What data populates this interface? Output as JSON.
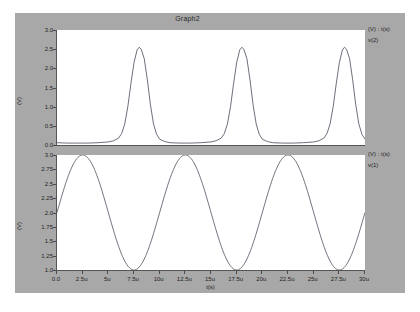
{
  "window": {
    "title": "Graph2",
    "background_color": "#a8a8a8",
    "plot_background_color": "#ffffff",
    "trace_color": "#4a4a5a"
  },
  "xaxis": {
    "label": "t(s)",
    "ticks": [
      "0.0",
      "2.5u",
      "5u",
      "7.5u",
      "10u",
      "12.5u",
      "15u",
      "17.5u",
      "20u",
      "22.5u",
      "25u",
      "27.5u",
      "30u"
    ],
    "min": 0,
    "max": 3e-05
  },
  "panels": [
    {
      "id": "top",
      "legend_axis": "(V) : t(s)",
      "legend_trace": "v(2)",
      "yaxis_label": "(V)",
      "yticks": [
        "3.0",
        "2.5",
        "2.0",
        "1.5",
        "1.0",
        "0.5",
        "0.0"
      ],
      "ymin": 0.0,
      "ymax": 3.0
    },
    {
      "id": "bottom",
      "legend_axis": "(V) : t(s)",
      "legend_trace": "v(1)",
      "yaxis_label": "(V)",
      "yticks": [
        "3.0",
        "2.75",
        "2.5",
        "2.25",
        "2.0",
        "1.75",
        "1.5",
        "1.25",
        "1.0"
      ],
      "ymin": 1.0,
      "ymax": 3.0
    }
  ],
  "chart_data": [
    {
      "type": "line",
      "id": "top",
      "title": "Graph2",
      "xlabel": "t(s)",
      "ylabel": "(V)",
      "xlim": [
        0,
        3e-05
      ],
      "ylim": [
        0.0,
        3.0
      ],
      "xtick_labels": [
        "0.0",
        "2.5u",
        "5u",
        "7.5u",
        "10u",
        "12.5u",
        "15u",
        "17.5u",
        "20u",
        "22.5u",
        "25u",
        "27.5u",
        "30u"
      ],
      "ytick_labels": [
        "0.0",
        "0.5",
        "1.0",
        "1.5",
        "2.0",
        "2.5",
        "3.0"
      ],
      "grid": false,
      "legend": [
        "v(2)"
      ],
      "legend_position": "right",
      "series": [
        {
          "name": "v(2)",
          "description": "Narrow rectified pulse train, peak 2.55 V near t=8u, 18u, 28u; baseline ~0.05 V, period 10u",
          "period_s": 1e-05,
          "peak_v": 2.55,
          "baseline_v": 0.05,
          "peak_times_s": [
            8e-06,
            1.8e-05,
            2.8e-05
          ],
          "points": [
            [
              0.0,
              0.06
            ],
            [
              1e-06,
              0.05
            ],
            [
              2e-06,
              0.05
            ],
            [
              3e-06,
              0.05
            ],
            [
              4e-06,
              0.06
            ],
            [
              5e-06,
              0.08
            ],
            [
              5.5e-06,
              0.11
            ],
            [
              6e-06,
              0.18
            ],
            [
              6.3e-06,
              0.3
            ],
            [
              6.6e-06,
              0.55
            ],
            [
              6.9e-06,
              1.0
            ],
            [
              7.2e-06,
              1.6
            ],
            [
              7.5e-06,
              2.15
            ],
            [
              7.8e-06,
              2.48
            ],
            [
              8e-06,
              2.55
            ],
            [
              8.2e-06,
              2.5
            ],
            [
              8.5e-06,
              2.25
            ],
            [
              8.8e-06,
              1.7
            ],
            [
              9.1e-06,
              1.05
            ],
            [
              9.4e-06,
              0.55
            ],
            [
              9.7e-06,
              0.28
            ],
            [
              1e-05,
              0.15
            ],
            [
              1.05e-05,
              0.09
            ],
            [
              1.1e-05,
              0.06
            ],
            [
              1.2e-05,
              0.05
            ],
            [
              1.3e-05,
              0.05
            ],
            [
              1.4e-05,
              0.06
            ],
            [
              1.5e-05,
              0.08
            ],
            [
              1.55e-05,
              0.11
            ],
            [
              1.6e-05,
              0.18
            ],
            [
              1.63e-05,
              0.3
            ],
            [
              1.66e-05,
              0.55
            ],
            [
              1.69e-05,
              1.0
            ],
            [
              1.72e-05,
              1.6
            ],
            [
              1.75e-05,
              2.15
            ],
            [
              1.78e-05,
              2.48
            ],
            [
              1.8e-05,
              2.55
            ],
            [
              1.82e-05,
              2.5
            ],
            [
              1.85e-05,
              2.25
            ],
            [
              1.88e-05,
              1.7
            ],
            [
              1.91e-05,
              1.05
            ],
            [
              1.94e-05,
              0.55
            ],
            [
              1.97e-05,
              0.28
            ],
            [
              2e-05,
              0.15
            ],
            [
              2.05e-05,
              0.09
            ],
            [
              2.1e-05,
              0.06
            ],
            [
              2.2e-05,
              0.05
            ],
            [
              2.3e-05,
              0.05
            ],
            [
              2.4e-05,
              0.06
            ],
            [
              2.5e-05,
              0.08
            ],
            [
              2.55e-05,
              0.11
            ],
            [
              2.6e-05,
              0.18
            ],
            [
              2.63e-05,
              0.3
            ],
            [
              2.66e-05,
              0.55
            ],
            [
              2.69e-05,
              1.0
            ],
            [
              2.72e-05,
              1.6
            ],
            [
              2.75e-05,
              2.15
            ],
            [
              2.78e-05,
              2.48
            ],
            [
              2.8e-05,
              2.55
            ],
            [
              2.82e-05,
              2.5
            ],
            [
              2.85e-05,
              2.25
            ],
            [
              2.88e-05,
              1.7
            ],
            [
              2.91e-05,
              1.05
            ],
            [
              2.94e-05,
              0.55
            ],
            [
              2.97e-05,
              0.28
            ],
            [
              3e-05,
              0.15
            ]
          ]
        }
      ]
    },
    {
      "type": "line",
      "id": "bottom",
      "xlabel": "t(s)",
      "ylabel": "(V)",
      "xlim": [
        0,
        3e-05
      ],
      "ylim": [
        1.0,
        3.0
      ],
      "xtick_labels": [
        "0.0",
        "2.5u",
        "5u",
        "7.5u",
        "10u",
        "12.5u",
        "15u",
        "17.5u",
        "20u",
        "22.5u",
        "25u",
        "27.5u",
        "30u"
      ],
      "ytick_labels": [
        "1.0",
        "1.25",
        "1.5",
        "1.75",
        "2.0",
        "2.25",
        "2.5",
        "2.75",
        "3.0"
      ],
      "grid": false,
      "legend": [
        "v(1)"
      ],
      "legend_position": "right",
      "series": [
        {
          "name": "v(1)",
          "description": "Sine wave, offset 2.0 V, amplitude 1.0 V, period 10u, rising through 2.0 V at t=0",
          "offset_v": 2.0,
          "amplitude_v": 1.0,
          "period_s": 1e-05,
          "phase_deg": 0
        }
      ]
    }
  ]
}
